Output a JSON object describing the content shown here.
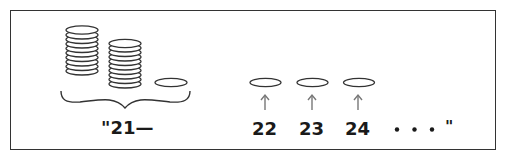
{
  "figure": {
    "group": {
      "stacks": [
        {
          "name": "stack-1",
          "coins": 10
        },
        {
          "name": "stack-2",
          "coins": 10
        }
      ],
      "single_coins": 1,
      "label": "\"21—"
    },
    "counted_coins": [
      {
        "label": "22"
      },
      {
        "label": "23"
      },
      {
        "label": "24"
      }
    ],
    "continuation": {
      "dots": "• • •",
      "closing_quote": "\""
    },
    "colors": {
      "line": "#333333",
      "arrow": "#777777",
      "text": "#1a1a1a"
    }
  }
}
